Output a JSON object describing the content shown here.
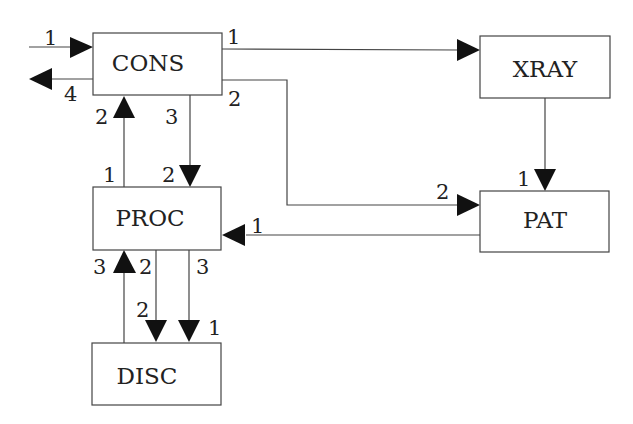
{
  "nodes": {
    "cons": {
      "label": "CONS"
    },
    "xray": {
      "label": "XRAY"
    },
    "pat": {
      "label": "PAT"
    },
    "proc": {
      "label": "PROC"
    },
    "disc": {
      "label": "DISC"
    }
  },
  "ports": {
    "ext_in": "1",
    "ext_out": "4",
    "cons_xray_out": "1",
    "cons_pat_out": "2",
    "cons_proc_out": "3",
    "cons_from_proc_in": "2",
    "proc_to_cons_out": "1",
    "proc_from_cons_in": "2",
    "xray_to_pat_in": "1",
    "pat_from_cons_in": "2",
    "proc_from_pat_in": "1",
    "proc_from_disc_in": "3",
    "proc_to_disc_out_a": "2",
    "proc_to_disc_out_b": "3",
    "disc_in_a": "2",
    "disc_in_b": "1"
  },
  "edges": [
    {
      "from": "external",
      "to": "CONS",
      "label": "1"
    },
    {
      "from": "CONS",
      "to": "external",
      "label": "4"
    },
    {
      "from": "CONS",
      "to": "XRAY",
      "labels": [
        "1"
      ]
    },
    {
      "from": "CONS",
      "to": "PAT",
      "labels": [
        "2",
        "2"
      ]
    },
    {
      "from": "CONS",
      "to": "PROC",
      "labels": [
        "3",
        "2"
      ]
    },
    {
      "from": "PROC",
      "to": "CONS",
      "labels": [
        "1",
        "2"
      ]
    },
    {
      "from": "XRAY",
      "to": "PAT",
      "labels": [
        "1"
      ]
    },
    {
      "from": "PAT",
      "to": "PROC",
      "labels": [
        "1"
      ]
    },
    {
      "from": "DISC",
      "to": "PROC",
      "labels": [
        "3"
      ]
    },
    {
      "from": "PROC",
      "to": "DISC",
      "labels": [
        "2",
        "2"
      ]
    },
    {
      "from": "PROC",
      "to": "DISC",
      "labels": [
        "3",
        "1"
      ]
    }
  ],
  "colors": {
    "line": "#444444",
    "arrow": "#111111",
    "background": "#ffffff"
  }
}
